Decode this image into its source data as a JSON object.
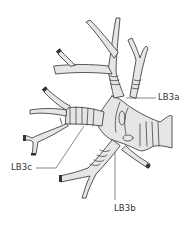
{
  "figure": {
    "fill_color": "#e6e6e6",
    "stroke_color": "#444444",
    "labels": [
      {
        "id": "lb3a",
        "text": "LB3a"
      },
      {
        "id": "lb3c",
        "text": "LB3c"
      },
      {
        "id": "lb3b",
        "text": "LB3b"
      }
    ]
  }
}
